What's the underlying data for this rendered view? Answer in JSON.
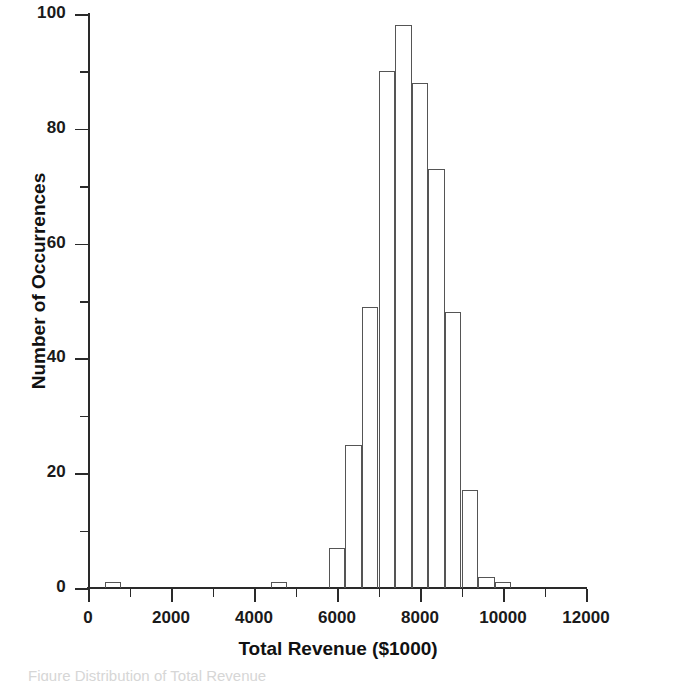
{
  "chart_data": {
    "type": "bar",
    "title": "",
    "subtitle": "",
    "xlabel": "Total Revenue  ($1000)",
    "ylabel": "Number of Occurrences",
    "xlim": [
      0,
      12000
    ],
    "ylim": [
      0,
      100
    ],
    "x_major_ticks": [
      0,
      2000,
      4000,
      6000,
      8000,
      10000,
      12000
    ],
    "x_minor_ticks": [
      1000,
      3000,
      5000,
      7000,
      9000,
      11000
    ],
    "x_tick_labels": [
      "0",
      "2000",
      "4000",
      "6000",
      "8000",
      "10000",
      "12000"
    ],
    "y_major_ticks": [
      0,
      20,
      40,
      60,
      80,
      100
    ],
    "y_minor_ticks": [
      10,
      30,
      50,
      70,
      90
    ],
    "y_tick_labels": [
      "0",
      "20",
      "40",
      "60",
      "80",
      "100"
    ],
    "grid": false,
    "legend": "none",
    "bin_width": 400,
    "bar_style": "outline-only",
    "bar_edge_color": "#555555",
    "bar_fill_color": "none",
    "axis_color": "#2a2a2a",
    "background_color": "#ffffff",
    "bins": [
      {
        "start": 400,
        "end": 800,
        "center": 600,
        "count": 1
      },
      {
        "start": 4400,
        "end": 4800,
        "center": 4600,
        "count": 1
      },
      {
        "start": 5800,
        "end": 6200,
        "center": 6000,
        "count": 7
      },
      {
        "start": 6200,
        "end": 6600,
        "center": 6400,
        "count": 25
      },
      {
        "start": 6600,
        "end": 7000,
        "center": 6800,
        "count": 49
      },
      {
        "start": 7000,
        "end": 7400,
        "center": 7200,
        "count": 90
      },
      {
        "start": 7400,
        "end": 7800,
        "center": 7600,
        "count": 98
      },
      {
        "start": 7800,
        "end": 8200,
        "center": 8000,
        "count": 88
      },
      {
        "start": 8200,
        "end": 8600,
        "center": 8400,
        "count": 73
      },
      {
        "start": 8600,
        "end": 9000,
        "center": 8800,
        "count": 48
      },
      {
        "start": 9000,
        "end": 9400,
        "center": 9200,
        "count": 17
      },
      {
        "start": 9400,
        "end": 9800,
        "center": 9600,
        "count": 2
      },
      {
        "start": 9800,
        "end": 10200,
        "center": 10000,
        "count": 1
      }
    ],
    "categories": [
      "600",
      "4600",
      "6000",
      "6400",
      "6800",
      "7200",
      "7600",
      "8000",
      "8400",
      "8800",
      "9200",
      "9600",
      "10000"
    ],
    "values": [
      1,
      1,
      7,
      25,
      49,
      90,
      98,
      88,
      73,
      48,
      17,
      2,
      1
    ]
  },
  "caption": {
    "text": "Figure    Distribution of Total Revenue"
  }
}
